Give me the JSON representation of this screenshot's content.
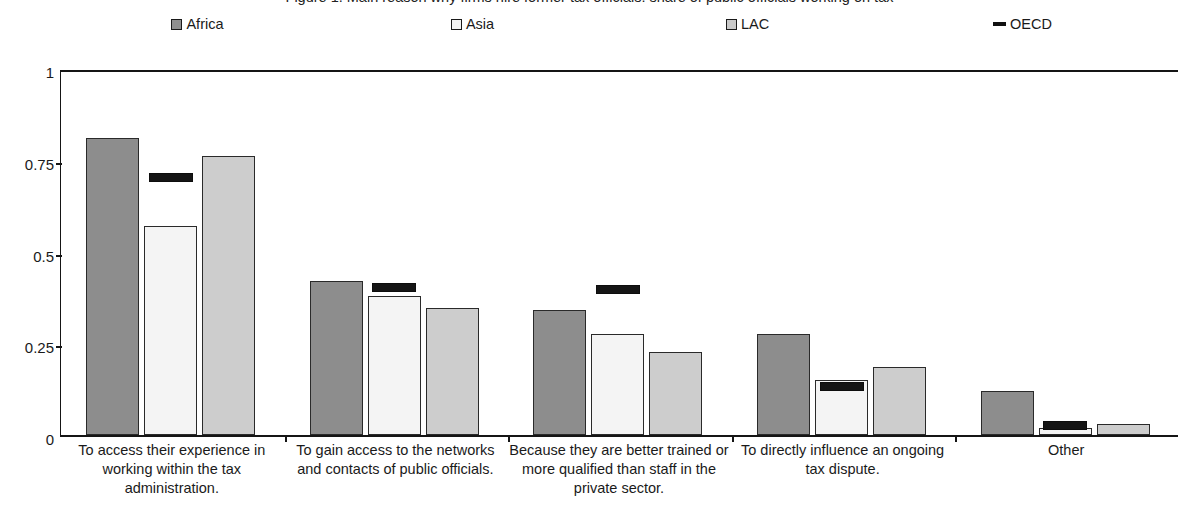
{
  "chart_title": "Figure 1. Main reason why firms hire former tax officials: share of public officials working on tax",
  "legend": {
    "items": [
      {
        "label": "Africa",
        "marker": "filled-square-dark",
        "color": "#8d8d8d"
      },
      {
        "label": "Asia",
        "marker": "filled-square-white",
        "color": "#f4f4f4"
      },
      {
        "label": "LAC",
        "marker": "filled-square-light",
        "color": "#cdcdcd"
      },
      {
        "label": "OECD",
        "marker": "dash-line-black",
        "color": "#151515"
      }
    ]
  },
  "chart_data": {
    "type": "bar",
    "title": "Figure 1. Main reason why firms hire former tax officials: share of public officials working on tax",
    "xlabel": "",
    "ylabel": "",
    "ylim": [
      0,
      1
    ],
    "yticks": [
      0,
      0.25,
      0.5,
      0.75,
      1
    ],
    "ytick_labels": [
      "0",
      "0.25",
      "0.5",
      "0.75",
      "1"
    ],
    "grid": false,
    "legend_position": "top",
    "categories": [
      "To access their experience in working within the tax administration.",
      "To gain access to the networks and contacts of public officials.",
      "Because they are better trained or more qualified than staff in the private sector.",
      "To directly influence an ongoing tax dispute.",
      "Other"
    ],
    "series": [
      {
        "name": "Africa",
        "type": "bar",
        "color": "#8d8d8d",
        "values": [
          0.81,
          0.42,
          0.34,
          0.275,
          0.12
        ]
      },
      {
        "name": "Asia",
        "type": "bar",
        "color": "#f4f4f4",
        "values": [
          0.57,
          0.38,
          0.275,
          0.15,
          0.02
        ]
      },
      {
        "name": "LAC",
        "type": "bar",
        "color": "#cdcdcd",
        "values": [
          0.76,
          0.345,
          0.225,
          0.185,
          0.03
        ]
      },
      {
        "name": "OECD",
        "type": "dash",
        "color": "#151515",
        "values": [
          0.7,
          0.4,
          0.395,
          0.13,
          0.025
        ]
      }
    ]
  }
}
